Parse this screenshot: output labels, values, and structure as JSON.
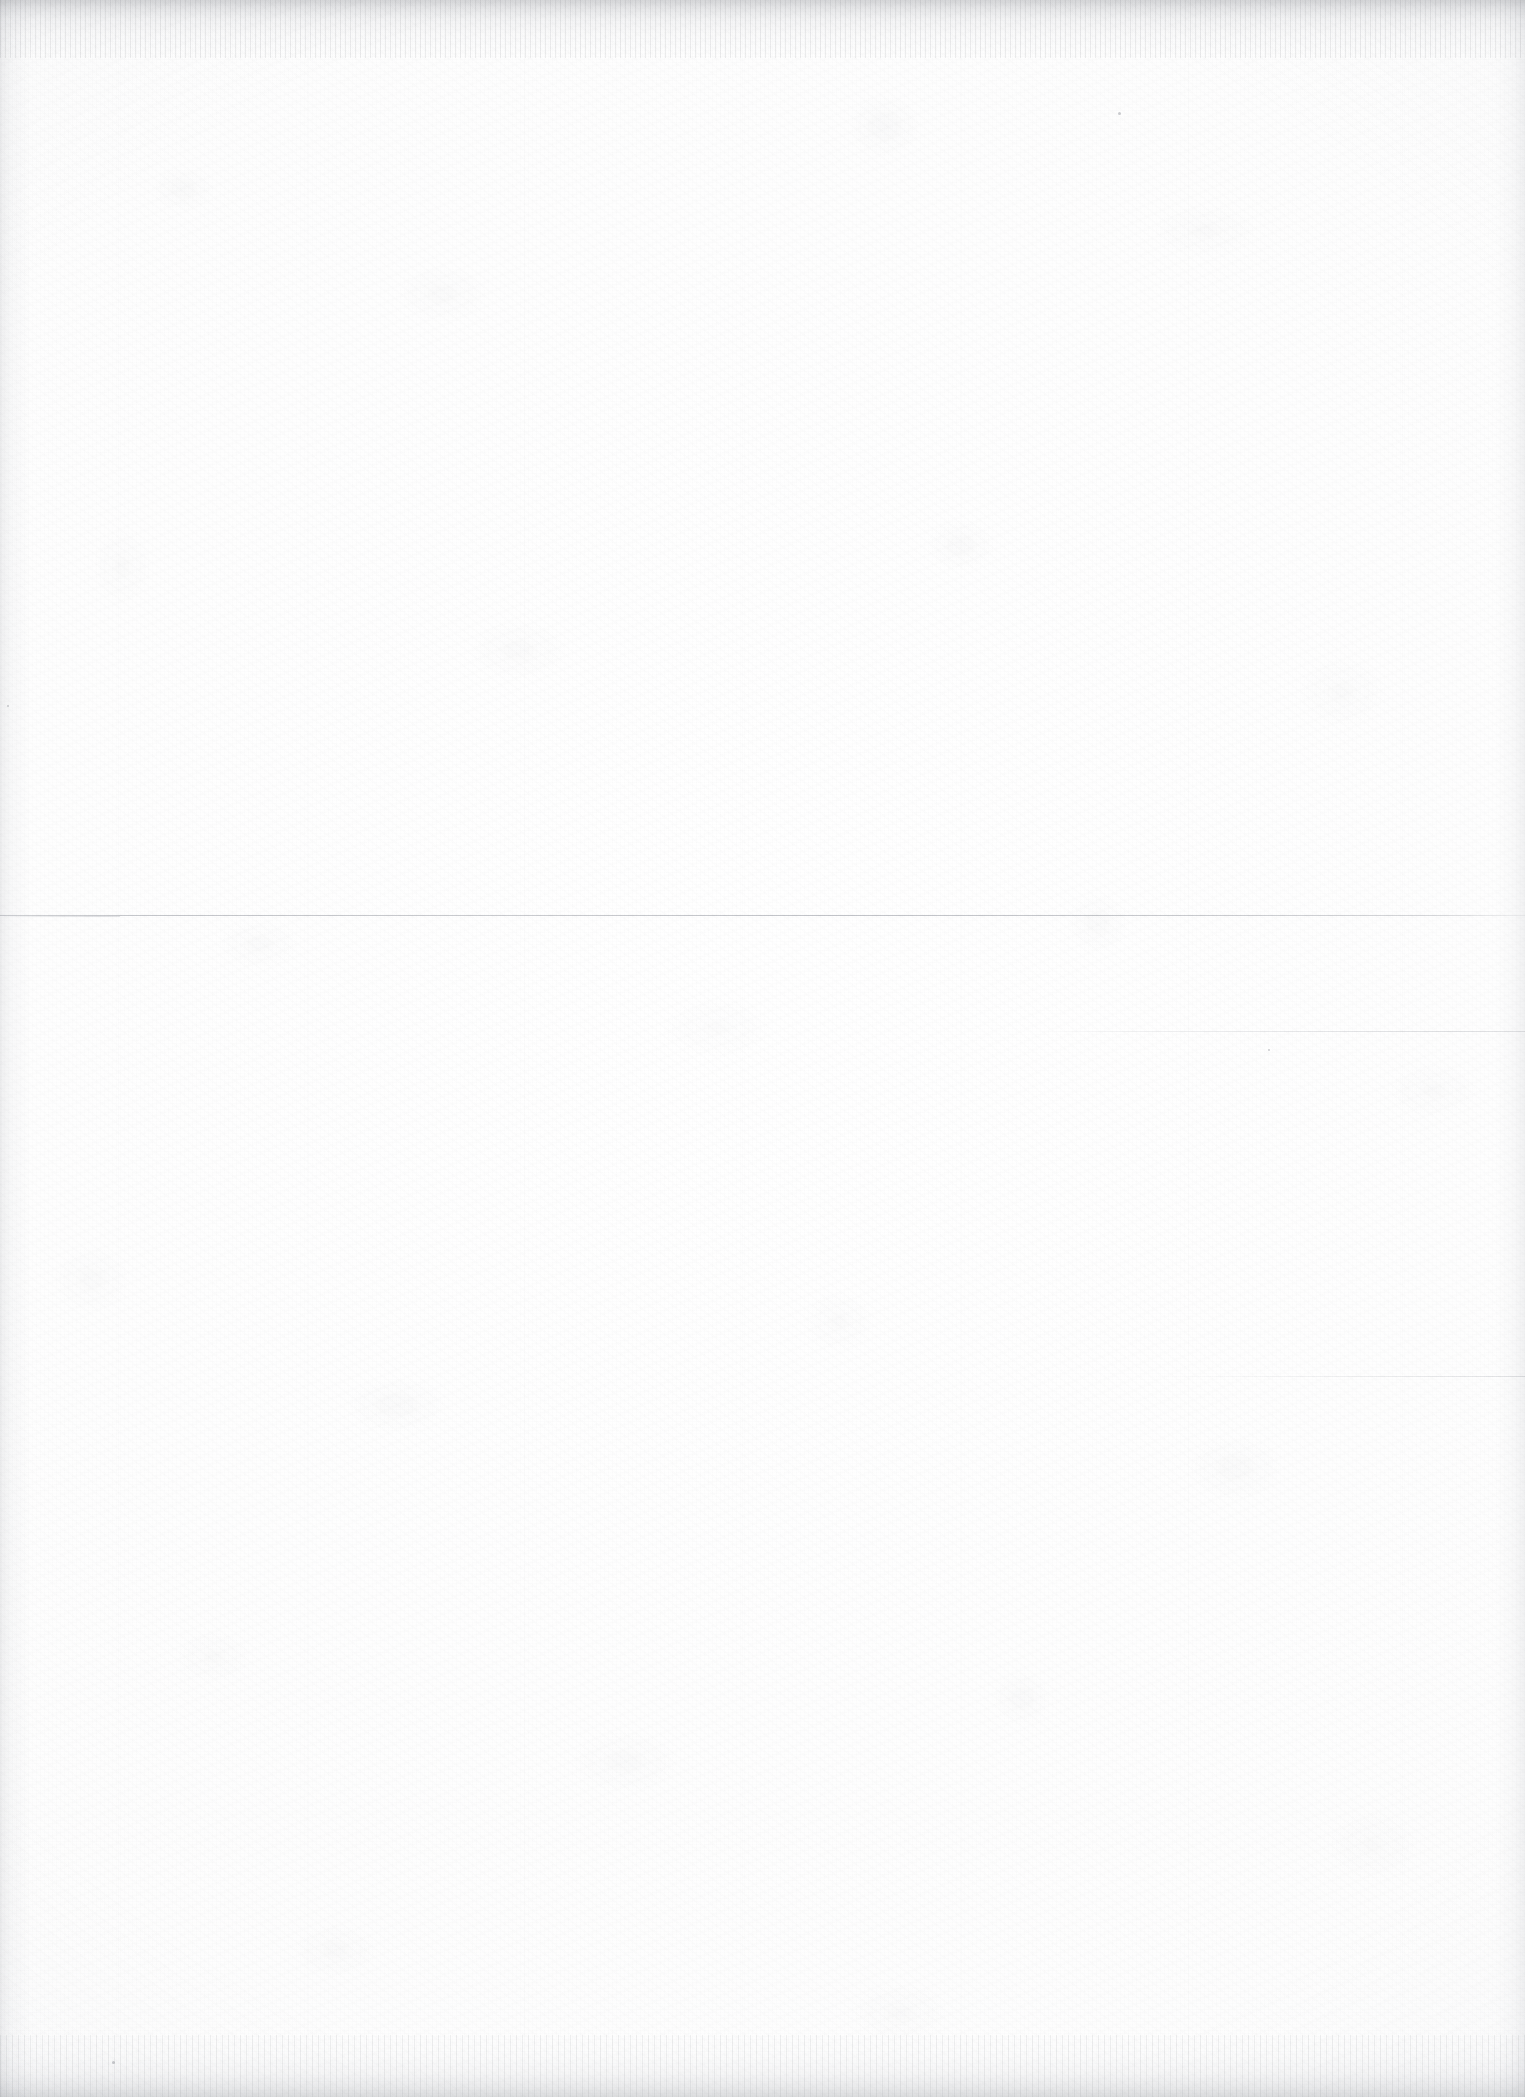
{
  "document": {
    "kind": "scanned-page",
    "description": "Blank scanned paper page",
    "visible_text": "",
    "page_background_color": "#fefefe",
    "paper_tone_color": "#f9f9fa",
    "artifact_color": "#7c808a"
  },
  "canvas": {
    "width": 1525,
    "height": 2097
  },
  "artifacts": {
    "edges": [
      {
        "name": "top-scan-edge",
        "position": "top",
        "thickness_px": 58
      },
      {
        "name": "bottom-scan-edge",
        "position": "bottom",
        "thickness_px": 62
      },
      {
        "name": "left-scan-edge",
        "position": "left",
        "thickness_px": 30
      },
      {
        "name": "right-scan-edge",
        "position": "right",
        "thickness_px": 30
      }
    ],
    "rules": [
      {
        "name": "full-width-hairline",
        "y": 915,
        "x": 0,
        "width": 1525,
        "strength": "primary"
      },
      {
        "name": "right-partial-line",
        "y": 1031,
        "x": 1040,
        "width": 485,
        "strength": "faint"
      },
      {
        "name": "right-wisp-line",
        "y": 1376,
        "x": 1150,
        "width": 375,
        "strength": "wisp"
      },
      {
        "name": "left-stub-line",
        "y": 916,
        "x": 0,
        "width": 120,
        "strength": "faint"
      }
    ],
    "specks": [
      {
        "name": "speck-upper-right",
        "x": 1118,
        "y": 112,
        "size": 3
      },
      {
        "name": "speck-lower-left",
        "x": 112,
        "y": 2061,
        "size": 3
      },
      {
        "name": "speck-mid-right",
        "x": 1268,
        "y": 1049,
        "size": 2
      },
      {
        "name": "speck-mid-left",
        "x": 7,
        "y": 705,
        "size": 2
      }
    ]
  }
}
